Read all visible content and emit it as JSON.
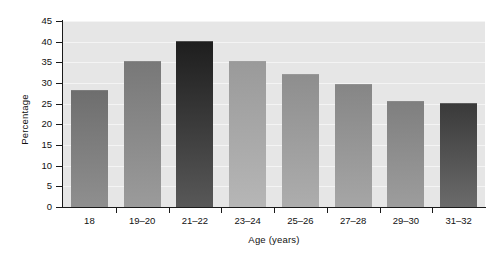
{
  "chart_data": {
    "type": "bar",
    "title": "",
    "xlabel": "Age (years)",
    "ylabel": "Percentage",
    "categories": [
      "18",
      "19–20",
      "21–22",
      "23–24",
      "25–26",
      "27–28",
      "29–30",
      "31–32"
    ],
    "values": [
      28,
      35,
      40,
      35,
      32,
      29.5,
      25.5,
      25
    ],
    "ylim": [
      0,
      45
    ],
    "ytick_labels": [
      "0",
      "5",
      "10",
      "15",
      "20",
      "25",
      "30",
      "35",
      "40",
      "45"
    ],
    "ytick_values": [
      0,
      5,
      10,
      15,
      20,
      25,
      30,
      35,
      40,
      45
    ],
    "grid": true,
    "legend": "none",
    "bar_colors": [
      "#6e6e6e",
      "#787878",
      "#1e1e1e",
      "#9a9a9a",
      "#8e8e8e",
      "#868686",
      "#7f7f7f",
      "#3a3a3a"
    ],
    "bar_colors_bottom": [
      "#8f8f8f",
      "#9b9b9b",
      "#585858",
      "#b6b6b6",
      "#adadad",
      "#a6a6a6",
      "#9d9d9d",
      "#6b6b6b"
    ],
    "panel_color": "#e6e6e6",
    "gridline_color": "#f4f4f4",
    "axis_color": "#1a1a1a",
    "background_color": "#ffffff"
  }
}
